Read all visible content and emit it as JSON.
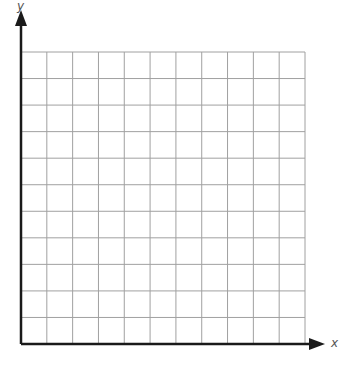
{
  "diagram": {
    "type": "coordinate-grid",
    "axes": {
      "x_label": "x",
      "y_label": "y",
      "axis_color": "#1a1a1a",
      "grid_color": "#a0a0a0"
    },
    "grid": {
      "columns": 11,
      "rows": 11,
      "left": 21,
      "right": 305,
      "top": 52,
      "bottom": 344
    }
  }
}
